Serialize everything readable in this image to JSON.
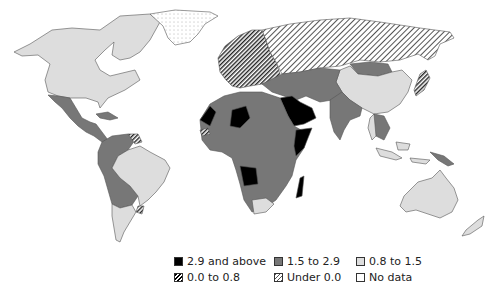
{
  "map": {
    "type": "choropleth",
    "region": "World",
    "colors": {
      "2.9 and above": "#000000",
      "1.5 to 2.9": "#777777",
      "0.8 to 1.5": "#dddddd",
      "0.0 to 0.8": "dense-hatch",
      "Under 0.0": "sparse-hatch",
      "No data": "#ffffff"
    }
  },
  "legend": {
    "rows": [
      [
        {
          "label": "2.9 and above",
          "swatch": "black"
        },
        {
          "label": "1.5 to 2.9",
          "swatch": "dark"
        },
        {
          "label": "0.8 to 1.5",
          "swatch": "light"
        }
      ],
      [
        {
          "label": "0.0 to 0.8",
          "swatch": "dense"
        },
        {
          "label": "Under 0.0",
          "swatch": "sparse"
        },
        {
          "label": "No data",
          "swatch": "none"
        }
      ]
    ]
  }
}
